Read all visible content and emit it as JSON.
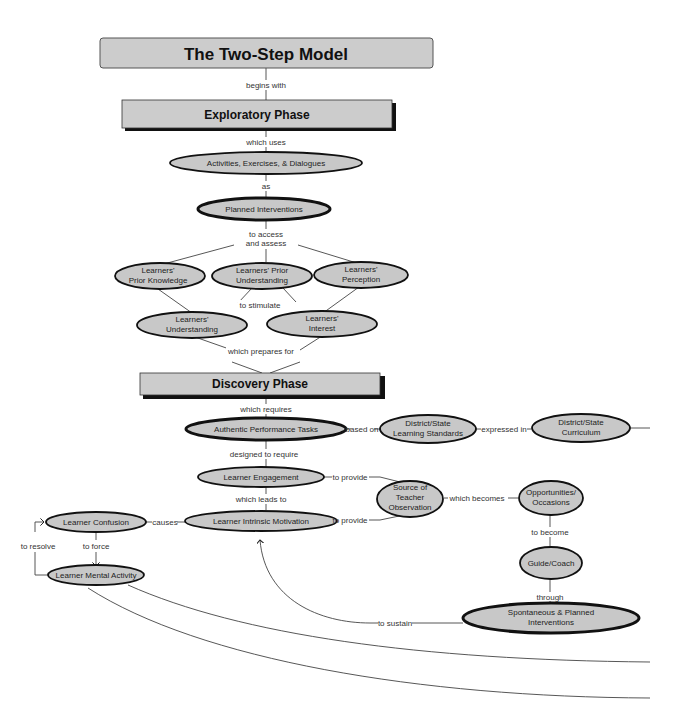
{
  "diagram": {
    "title": "The Two-Step Model",
    "phases": {
      "exploratory": "Exploratory Phase",
      "discovery": "Discovery Phase"
    },
    "nodes": {
      "activities": "Activities, Exercises, & Dialogues",
      "planned_interventions": "Planned Interventions",
      "prior_knowledge": [
        "Learners'",
        "Prior Knowledge"
      ],
      "prior_understanding": [
        "Learners' Prior",
        "Understanding"
      ],
      "perception": [
        "Learners'",
        "Perception"
      ],
      "understanding": [
        "Learners'",
        "Understanding"
      ],
      "interest": [
        "Learners'",
        "Interest"
      ],
      "authentic_tasks": "Authentic Performance Tasks",
      "learning_standards": [
        "District/State",
        "Learning Standards"
      ],
      "curriculum": [
        "District/State",
        "Curriculum"
      ],
      "engagement": "Learner Engagement",
      "intrinsic_motivation": "Learner Intrinsic Motivation",
      "confusion": "Learner Confusion",
      "mental_activity": "Learner Mental Activity",
      "teacher_observation": [
        "Source of",
        "Teacher",
        "Observation"
      ],
      "opportunities": [
        "Opportunities/",
        "Occasions"
      ],
      "guide_coach": "Guide/Coach",
      "spontaneous_interventions": [
        "Spontaneous & Planned",
        "Interventions"
      ]
    },
    "links": {
      "begins_with": "begins with",
      "which_uses": "which uses",
      "as": "as",
      "to_access": [
        "to access",
        "and assess"
      ],
      "to_stimulate": "to stimulate",
      "which_prepares_for": "which prepares for",
      "which_requires": "which requires",
      "based_on": "based on",
      "expressed_in": "expressed in",
      "designed_to_require": "designed to require",
      "to_provide_1": "to provide",
      "to_provide_2": "to provide",
      "which_leads_to": "which leads to",
      "causes": "causes",
      "to_force": "to force",
      "to_resolve": "to resolve",
      "which_becomes": "which becomes",
      "to_become": "to become",
      "through": "through",
      "to_sustain": "to sustain"
    },
    "colors": {
      "node_fill": "#c8c8c8",
      "border": "#111111",
      "line": "#444444"
    }
  }
}
